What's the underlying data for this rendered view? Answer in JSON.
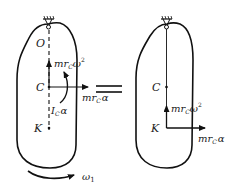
{
  "figure": {
    "left_panel": {
      "points": {
        "O": "O",
        "C": "C",
        "K": "K"
      },
      "forces": {
        "centripetal": {
          "base": "mr",
          "sub": "C",
          "tail": "ω",
          "sup": "2"
        },
        "tangential": {
          "base": "mr",
          "sub": "C",
          "tail": "α"
        },
        "moment": {
          "base": "I",
          "sub": "C",
          "tail": "α"
        }
      },
      "rotation": {
        "base": "ω",
        "sub": "1"
      }
    },
    "equals": "=",
    "right_panel": {
      "points": {
        "C": "C",
        "K": "K"
      },
      "forces": {
        "centripetal": {
          "base": "mr",
          "sub": "C",
          "tail": "ω",
          "sup": "2"
        },
        "tangential": {
          "base": "mr",
          "sub": "C",
          "tail": "α"
        }
      }
    },
    "colors": {
      "stroke": "#111111",
      "text": "#222222",
      "background": "#ffffff"
    }
  }
}
